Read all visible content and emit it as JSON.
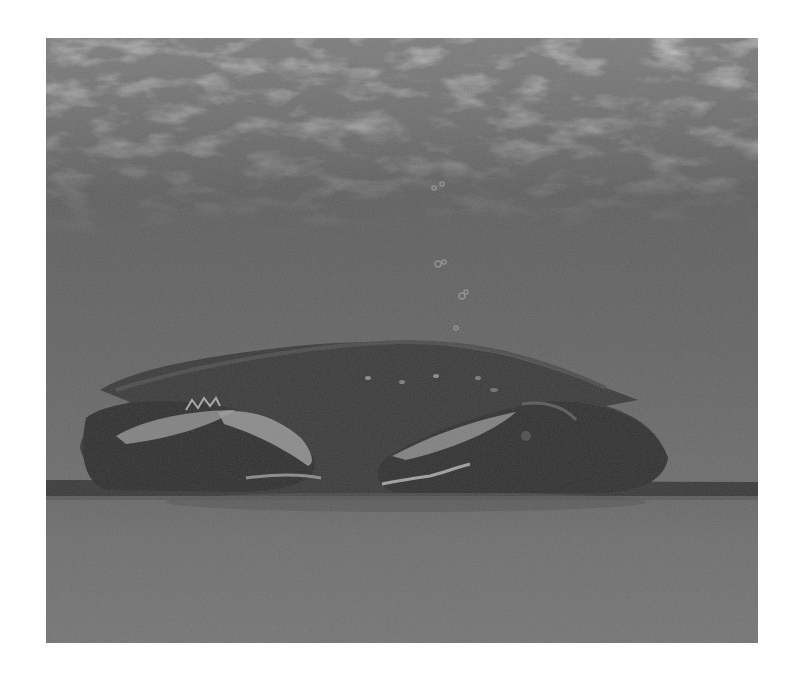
{
  "image": {
    "subject": "crab",
    "description": "Grayscale painting of a crab resting on the sea floor underwater with rising bubbles",
    "style": "grayscale pastel illustration",
    "colors": {
      "background": "#ffffff",
      "water_top": "#7a7a7a",
      "water_mid": "#5f5f5f",
      "water_lower": "#686868",
      "seafloor_line": "#3a3a3a",
      "seafloor": "#707070",
      "crab_shell": "#3b3b3b",
      "crab_dark": "#2e2e2e",
      "claw_highlight": "#9a9a9a"
    },
    "bounds": {
      "x": 46,
      "y": 38,
      "width": 712,
      "height": 605
    }
  }
}
